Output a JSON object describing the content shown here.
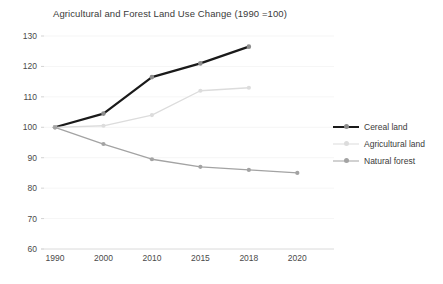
{
  "chart_data": {
    "type": "line",
    "title": "Agricultural and Forest Land Use Change (1990 =100)",
    "xlabel": "",
    "ylabel": "",
    "categories": [
      "1990",
      "2000",
      "2010",
      "2015",
      "2018",
      "2020"
    ],
    "ylim": [
      60,
      130
    ],
    "yticks": [
      60,
      70,
      80,
      90,
      100,
      110,
      120,
      130
    ],
    "ytick_labels": [
      "60",
      "70",
      "80",
      "90",
      "100",
      "110",
      "120",
      "130"
    ],
    "grid": true,
    "legend_position": "right",
    "series": [
      {
        "name": "Cereal land",
        "color": "#1a1a1a",
        "values": [
          100,
          104.5,
          116.5,
          121,
          126.5,
          null
        ]
      },
      {
        "name": "Agricultural land",
        "color": "#dcdcdc",
        "values": [
          100,
          100.5,
          104,
          112,
          113,
          null
        ]
      },
      {
        "name": "Natural forest",
        "color": "#a3a3a3",
        "values": [
          100,
          94.5,
          89.5,
          87,
          86,
          85
        ]
      }
    ]
  },
  "legend": {
    "items": [
      {
        "label": "Cereal land"
      },
      {
        "label": "Agricultural land"
      },
      {
        "label": "Natural forest"
      }
    ]
  }
}
